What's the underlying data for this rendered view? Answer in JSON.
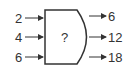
{
  "diagram": {
    "machine": {
      "label": "?"
    },
    "inputs": [
      "2",
      "4",
      "6"
    ],
    "outputs": [
      "6",
      "12",
      "18"
    ],
    "colors": {
      "stroke": "#333333",
      "text": "#333333"
    }
  }
}
